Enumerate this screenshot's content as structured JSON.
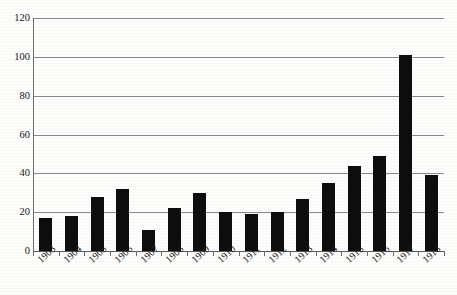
{
  "chart_data": {
    "type": "bar",
    "title": "",
    "subtitle": "",
    "xlabel": "",
    "ylabel": "",
    "categories": [
      "1903",
      "1904",
      "1905",
      "1906",
      "1907",
      "1908",
      "1909",
      "1910",
      "1911",
      "1912",
      "1913",
      "1914",
      "1915",
      "1916",
      "1917",
      "1918"
    ],
    "values": [
      17,
      18,
      28,
      32,
      11,
      22,
      30,
      20,
      19,
      20,
      27,
      35,
      44,
      49,
      101,
      39
    ],
    "ylim": [
      0,
      120
    ],
    "ytick_values": [
      0,
      20,
      40,
      60,
      80,
      100,
      120
    ],
    "ytick_labels": [
      "0",
      "20",
      "40",
      "60",
      "80",
      "100",
      "120"
    ],
    "grid": true,
    "grid_axis": "y",
    "legend": false,
    "legend_position": "none",
    "bar_color": "#0d0d0d",
    "grid_color": "#8a8a8a",
    "axis_color": "#6e6e6e",
    "background_color": "#fdfdfc",
    "xtick_label_rotation": -43
  },
  "axes": {
    "y": {
      "ticks": [
        {
          "label": "120",
          "value": 120
        },
        {
          "label": "100",
          "value": 100
        },
        {
          "label": "80",
          "value": 80
        },
        {
          "label": "60",
          "value": 60
        },
        {
          "label": "40",
          "value": 40
        },
        {
          "label": "20",
          "value": 20
        },
        {
          "label": "0",
          "value": 0
        }
      ]
    },
    "x": {
      "ticks": [
        {
          "label": "1903"
        },
        {
          "label": "1904"
        },
        {
          "label": "1905"
        },
        {
          "label": "1906"
        },
        {
          "label": "1907"
        },
        {
          "label": "1908"
        },
        {
          "label": "1909"
        },
        {
          "label": "1910"
        },
        {
          "label": "1911"
        },
        {
          "label": "1912"
        },
        {
          "label": "1913"
        },
        {
          "label": "1914"
        },
        {
          "label": "1915"
        },
        {
          "label": "1916"
        },
        {
          "label": "1917"
        },
        {
          "label": "1918"
        }
      ]
    }
  },
  "bars": [
    {
      "category": "1903",
      "value": 17
    },
    {
      "category": "1904",
      "value": 18
    },
    {
      "category": "1905",
      "value": 28
    },
    {
      "category": "1906",
      "value": 32
    },
    {
      "category": "1907",
      "value": 11
    },
    {
      "category": "1908",
      "value": 22
    },
    {
      "category": "1909",
      "value": 30
    },
    {
      "category": "1910",
      "value": 20
    },
    {
      "category": "1911",
      "value": 19
    },
    {
      "category": "1912",
      "value": 20
    },
    {
      "category": "1913",
      "value": 27
    },
    {
      "category": "1914",
      "value": 35
    },
    {
      "category": "1915",
      "value": 44
    },
    {
      "category": "1916",
      "value": 49
    },
    {
      "category": "1917",
      "value": 101
    },
    {
      "category": "1918",
      "value": 39
    }
  ]
}
